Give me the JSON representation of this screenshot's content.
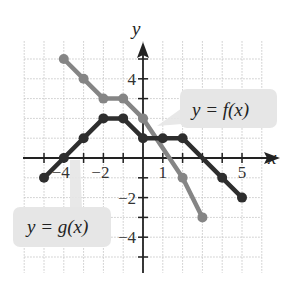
{
  "chart_data": {
    "type": "line",
    "title": "",
    "xlabel": "x",
    "ylabel": "y",
    "xlim": [
      -6,
      6
    ],
    "ylim": [
      -6,
      6
    ],
    "grid": true,
    "x_tick_labels": [
      {
        "value": -4,
        "label": "−4"
      },
      {
        "value": -2,
        "label": "−2"
      },
      {
        "value": 1,
        "label": "1"
      },
      {
        "value": 5,
        "label": "5"
      }
    ],
    "y_tick_labels": [
      {
        "value": 4,
        "label": "4"
      },
      {
        "value": -2,
        "label": "−2"
      },
      {
        "value": -4,
        "label": "−4"
      }
    ],
    "series": [
      {
        "name": "f",
        "label": "y = f(x)",
        "color": "#858585",
        "points": [
          [
            -4,
            5
          ],
          [
            -3,
            4
          ],
          [
            -2,
            3
          ],
          [
            -1,
            3
          ],
          [
            0,
            2
          ],
          [
            2,
            -1
          ],
          [
            3,
            -3
          ]
        ]
      },
      {
        "name": "g",
        "label": "y = g(x)",
        "color": "#2e2e2e",
        "points": [
          [
            -5,
            -1
          ],
          [
            -4,
            0
          ],
          [
            -3,
            1
          ],
          [
            -2,
            2
          ],
          [
            -1,
            2
          ],
          [
            0,
            1
          ],
          [
            1,
            1
          ],
          [
            2,
            1
          ],
          [
            4,
            -1
          ],
          [
            5,
            -2
          ]
        ]
      }
    ],
    "annotations": [
      {
        "text": "y = f(x)",
        "series": "f"
      },
      {
        "text": "y = g(x)",
        "series": "g"
      }
    ]
  },
  "labels": {
    "x_axis": "x",
    "y_axis": "y",
    "f_callout": "y = f(x)",
    "g_callout": "y = g(x)"
  },
  "colors": {
    "grid": "#c8c8c8",
    "axis": "#222222",
    "callout_bg": "#e6e6e6"
  }
}
